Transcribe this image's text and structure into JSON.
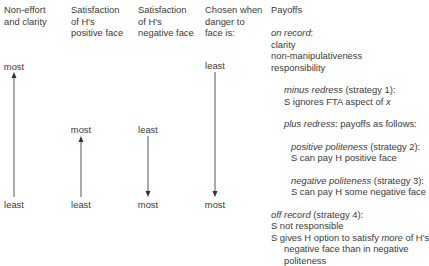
{
  "headers": {
    "col1": "Non-effort\nand clarity",
    "col2": "Satisfaction\nof H's\npositive face",
    "col3": "Satisfaction\nof H's\nnegative face",
    "col4": "Chosen when\ndanger to\nface is:",
    "col5": "Payoffs"
  },
  "scales": {
    "col1": {
      "top": "most",
      "bottom": "least",
      "direction": "up"
    },
    "col2": {
      "top": "most",
      "bottom": "least",
      "direction": "up"
    },
    "col3": {
      "top": "least",
      "bottom": "most",
      "direction": "down"
    },
    "col4": {
      "top": "least",
      "bottom": "most",
      "direction": "down"
    }
  },
  "payoffs": {
    "on_record": {
      "title": "on record",
      "suffix": ":",
      "items": [
        "clarity",
        "non-manipulativeness",
        "responsibility"
      ]
    },
    "minus_redress": {
      "title": "minus redress",
      "suffix": " (strategy 1):",
      "text_prefix": "S ignores FTA aspect of ",
      "text_var": "x"
    },
    "plus_redress": {
      "title": "plus redress",
      "suffix": ": payoffs as follows:"
    },
    "positive_politeness": {
      "title": "positive politeness",
      "suffix": " (strategy 2):",
      "text": "S can pay H positive face"
    },
    "negative_politeness": {
      "title": "negative politeness",
      "suffix": " (strategy 3):",
      "text": "S can pay H some negative face"
    },
    "off_record": {
      "title": "off record",
      "suffix": " (strategy 4):",
      "line1": "S not responsible",
      "line2_prefix": "S gives H option to satisfy ",
      "line2_em": "more",
      "line2_suffix": " of H's",
      "line3": "negative face than in negative",
      "line4": "politeness"
    }
  },
  "colors": {
    "text": "#3a3a3a",
    "arrow": "#555555"
  }
}
